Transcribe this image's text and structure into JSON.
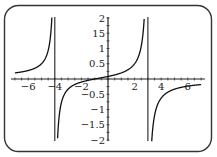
{
  "chart_data": {
    "type": "line",
    "title": "",
    "xlabel": "",
    "ylabel": "",
    "xlim": [
      -7,
      7
    ],
    "ylim": [
      -2,
      2
    ],
    "grid": false,
    "legend": null,
    "function_description": "rational function with vertical asymptotes at x = -4 and x = 3",
    "vertical_asymptotes": [
      -4,
      3
    ],
    "x_ticks": [
      -6,
      -4,
      -2,
      2,
      4,
      6
    ],
    "x_tick_labels": [
      "-6",
      "-4",
      "-2",
      "2",
      "4",
      "6"
    ],
    "y_ticks": [
      2,
      1.5,
      1,
      0.5,
      -0.5,
      -1,
      -1.5,
      -2
    ],
    "y_tick_labels": [
      "2",
      "15",
      "1",
      "0.5",
      "-0.5",
      "-1",
      "-1.5",
      "-2"
    ],
    "series": [
      {
        "name": "left branch",
        "x": [
          -7,
          -6.5,
          -6,
          -5.5,
          -5,
          -4.6,
          -4.3,
          -4.15
        ],
        "y": [
          0.2,
          0.245,
          0.278,
          0.35,
          0.5,
          0.83,
          1.7,
          2.0
        ]
      },
      {
        "name": "middle branch",
        "x": [
          -3.85,
          -3.7,
          -3.5,
          -3,
          -2,
          -1,
          0,
          1,
          2,
          2.5,
          2.8,
          2.88
        ],
        "y": [
          -2.0,
          -1.0,
          -0.38,
          -0.17,
          -0.05,
          0.0,
          0.083,
          0.2,
          0.5,
          0.92,
          2.2,
          2.0
        ]
      },
      {
        "name": "right branch",
        "x": [
          3.12,
          3.2,
          3.5,
          4,
          5,
          6,
          7
        ],
        "y": [
          -2.0,
          -1.8,
          -0.83,
          -0.53,
          -0.33,
          -0.23,
          -0.18
        ]
      }
    ],
    "formula_estimate": "y = -(x+1)/((x+4)(x-3))"
  }
}
